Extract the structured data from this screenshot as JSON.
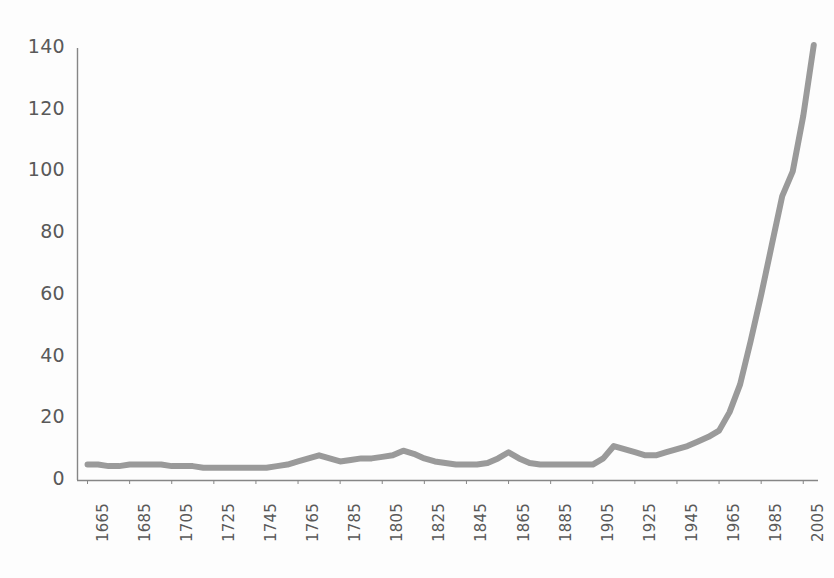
{
  "chart_data": {
    "type": "line",
    "title": "",
    "subtitle": "",
    "xlabel": "",
    "ylabel": "",
    "xlim": [
      1660,
      2012
    ],
    "ylim": [
      0,
      140
    ],
    "grid": false,
    "legend": false,
    "legend_position": "none",
    "series_color": "#9a9a9a",
    "axis_color": "#868686",
    "tick_label_color": "#595959",
    "y_ticks": [
      0,
      20,
      40,
      60,
      80,
      100,
      120,
      140
    ],
    "y_tick_labels": [
      "0",
      "20",
      "40",
      "60",
      "80",
      "100",
      "120",
      "140"
    ],
    "x_ticks": [
      1665,
      1685,
      1705,
      1725,
      1745,
      1765,
      1785,
      1805,
      1825,
      1845,
      1865,
      1885,
      1905,
      1925,
      1945,
      1965,
      1985,
      2005
    ],
    "x_tick_labels": [
      "1665",
      "1685",
      "1705",
      "1725",
      "1745",
      "1765",
      "1785",
      "1805",
      "1825",
      "1845",
      "1865",
      "1885",
      "1905",
      "1925",
      "1945",
      "1965",
      "1985",
      "2005"
    ],
    "series": [
      {
        "name": "series-1",
        "color": "#9a9a9a",
        "line_width": 6,
        "markers": false,
        "x": [
          1665,
          1670,
          1675,
          1680,
          1685,
          1690,
          1695,
          1700,
          1705,
          1710,
          1715,
          1720,
          1725,
          1730,
          1735,
          1740,
          1745,
          1750,
          1755,
          1760,
          1765,
          1770,
          1775,
          1780,
          1785,
          1790,
          1795,
          1800,
          1805,
          1810,
          1815,
          1820,
          1825,
          1830,
          1835,
          1840,
          1845,
          1850,
          1855,
          1860,
          1865,
          1870,
          1875,
          1880,
          1885,
          1890,
          1895,
          1900,
          1905,
          1910,
          1915,
          1920,
          1925,
          1930,
          1935,
          1940,
          1945,
          1950,
          1955,
          1960,
          1965,
          1970,
          1975,
          1980,
          1985,
          1990,
          1995,
          2000,
          2005,
          2010
        ],
        "y": [
          5,
          5,
          4.5,
          4.5,
          5,
          5,
          5,
          5,
          4.5,
          4.5,
          4.5,
          4,
          4,
          4,
          4,
          4,
          4,
          4,
          4.5,
          5,
          6,
          7,
          8,
          7,
          6,
          6.5,
          7,
          7,
          7.5,
          8,
          9.5,
          8.5,
          7,
          6,
          5.5,
          5,
          5,
          5,
          5.5,
          7,
          9,
          7,
          5.5,
          5,
          5,
          5,
          5,
          5,
          5,
          7,
          11,
          10,
          9,
          8,
          8,
          9,
          10,
          11,
          12.5,
          14,
          16,
          22,
          31,
          45,
          60,
          76,
          92,
          100,
          118,
          141
        ]
      }
    ]
  },
  "layout": {
    "plot_left_px": 77,
    "plot_right_px": 818,
    "plot_top_px": 48,
    "plot_bottom_px": 480
  }
}
